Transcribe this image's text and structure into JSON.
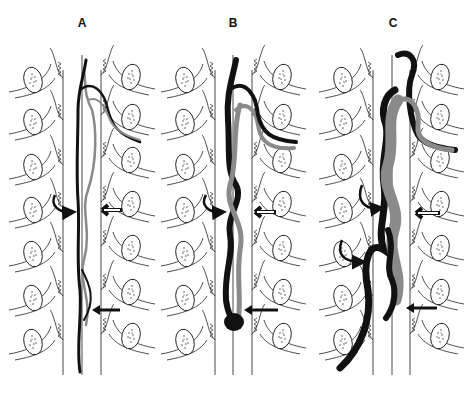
{
  "figure": {
    "type": "schematic",
    "panels": [
      {
        "id": "A",
        "label": "A",
        "center_x": 82,
        "lines_x": [
          63,
          82,
          101
        ],
        "description": "thin dark and gray tortuous vessels along cord"
      },
      {
        "id": "B",
        "label": "B",
        "center_x": 233,
        "lines_x": [
          215,
          233,
          252
        ],
        "description": "thicker tortuous dark and gray vessels with bulb at lower end"
      },
      {
        "id": "C",
        "label": "C",
        "center_x": 392,
        "lines_x": [
          373,
          392,
          410
        ],
        "description": "markedly enlarged tortuous dark and gray vessels"
      }
    ],
    "levels_y": [
      75,
      118,
      162,
      205,
      248,
      292,
      336
    ],
    "arrows": [
      {
        "type": "curved-black",
        "side": "left",
        "meaning": "feeder inflow"
      },
      {
        "type": "outlined-white",
        "side": "right",
        "meaning": "marker"
      },
      {
        "type": "straight-black",
        "side": "right",
        "meaning": "marker"
      },
      {
        "type": "curved-black-second",
        "side": "left",
        "panel": "C"
      }
    ],
    "colors": {
      "line": "#222222",
      "vessel_dark": "#111111",
      "vessel_gray": "#8a8a8a",
      "background": "#ffffff"
    }
  }
}
